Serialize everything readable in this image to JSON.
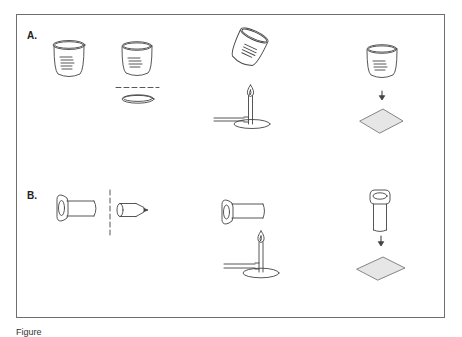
{
  "figure": {
    "panels": [
      {
        "label": "A.",
        "steps": [
          {
            "name": "beaker",
            "description": "Beaker with graduation marks"
          },
          {
            "name": "beaker-cut",
            "description": "Beaker separated from its base along a dashed cut line"
          },
          {
            "name": "beaker-flame",
            "description": "Tilted beaker held over Bunsen burner flame"
          },
          {
            "name": "beaker-to-paper",
            "description": "Beaker placed down onto a sheet (arrow)"
          }
        ]
      },
      {
        "label": "B.",
        "steps": [
          {
            "name": "tube-cut",
            "description": "Tube with flared end cut along dashed line; tapered tip removed"
          },
          {
            "name": "tube-flame",
            "description": "Tube held over Bunsen burner flame"
          },
          {
            "name": "tube-to-paper",
            "description": "Upright tube placed onto a sheet (arrow)"
          }
        ]
      }
    ],
    "caption": "Figure"
  },
  "colors": {
    "line": "#444444",
    "frame": "#6e6e6e",
    "sheet_fill": "#e6e6e6"
  }
}
